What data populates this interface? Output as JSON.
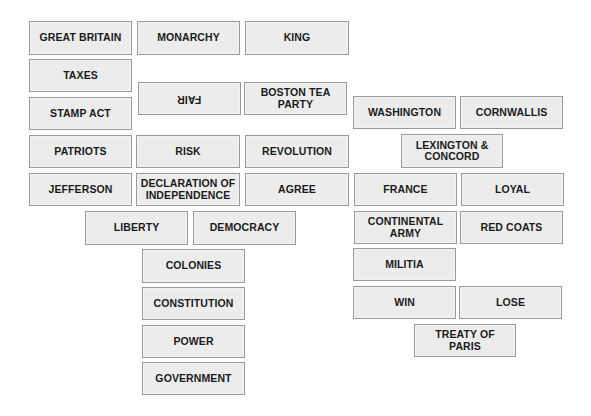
{
  "colors": {
    "card_fill": "#ececec",
    "card_border": "#9a9a9a",
    "card_text": "#1b1b1b",
    "background": "#ffffff"
  },
  "cards": [
    {
      "label": "GREAT BRITAIN",
      "x": 29,
      "y": 21,
      "w": 103,
      "h": 34,
      "rotated": false
    },
    {
      "label": "MONARCHY",
      "x": 137,
      "y": 21,
      "w": 103,
      "h": 34,
      "rotated": false
    },
    {
      "label": "KING",
      "x": 245,
      "y": 21,
      "w": 104,
      "h": 34,
      "rotated": false
    },
    {
      "label": "TAXES",
      "x": 29,
      "y": 59,
      "w": 103,
      "h": 33,
      "rotated": false
    },
    {
      "label": "FAIR",
      "x": 138,
      "y": 82,
      "w": 103,
      "h": 33,
      "rotated": true
    },
    {
      "label": "BOSTON TEA\nPARTY",
      "x": 244,
      "y": 82,
      "w": 103,
      "h": 33,
      "rotated": false
    },
    {
      "label": "STAMP ACT",
      "x": 29,
      "y": 97,
      "w": 103,
      "h": 33,
      "rotated": false
    },
    {
      "label": "WASHINGTON",
      "x": 353,
      "y": 96,
      "w": 103,
      "h": 33,
      "rotated": false
    },
    {
      "label": "CORNWALLIS",
      "x": 460,
      "y": 96,
      "w": 103,
      "h": 33,
      "rotated": false
    },
    {
      "label": "LEXINGTON &\nCONCORD",
      "x": 401,
      "y": 134,
      "w": 102,
      "h": 34,
      "rotated": false
    },
    {
      "label": "PATRIOTS",
      "x": 29,
      "y": 135,
      "w": 103,
      "h": 33,
      "rotated": false
    },
    {
      "label": "RISK",
      "x": 136,
      "y": 135,
      "w": 104,
      "h": 33,
      "rotated": false
    },
    {
      "label": "REVOLUTION",
      "x": 245,
      "y": 135,
      "w": 104,
      "h": 33,
      "rotated": false
    },
    {
      "label": "JEFFERSON",
      "x": 29,
      "y": 173,
      "w": 103,
      "h": 33,
      "rotated": false
    },
    {
      "label": "DECLARATION OF\nINDEPENDENCE",
      "x": 136,
      "y": 173,
      "w": 104,
      "h": 33,
      "rotated": false
    },
    {
      "label": "AGREE",
      "x": 245,
      "y": 173,
      "w": 104,
      "h": 33,
      "rotated": false
    },
    {
      "label": "FRANCE",
      "x": 354,
      "y": 173,
      "w": 103,
      "h": 33,
      "rotated": false
    },
    {
      "label": "LOYAL",
      "x": 461,
      "y": 173,
      "w": 103,
      "h": 33,
      "rotated": false
    },
    {
      "label": "LIBERTY",
      "x": 85,
      "y": 211,
      "w": 103,
      "h": 34,
      "rotated": false
    },
    {
      "label": "DEMOCRACY",
      "x": 193,
      "y": 211,
      "w": 103,
      "h": 34,
      "rotated": false
    },
    {
      "label": "CONTINENTAL\nARMY",
      "x": 354,
      "y": 211,
      "w": 103,
      "h": 33,
      "rotated": false
    },
    {
      "label": "RED COATS",
      "x": 460,
      "y": 211,
      "w": 103,
      "h": 33,
      "rotated": false
    },
    {
      "label": "COLONIES",
      "x": 142,
      "y": 249,
      "w": 103,
      "h": 34,
      "rotated": false
    },
    {
      "label": "MILITIA",
      "x": 353,
      "y": 248,
      "w": 103,
      "h": 33,
      "rotated": false
    },
    {
      "label": "CONSTITUTION",
      "x": 142,
      "y": 287,
      "w": 103,
      "h": 33,
      "rotated": false
    },
    {
      "label": "WIN",
      "x": 353,
      "y": 286,
      "w": 103,
      "h": 33,
      "rotated": false
    },
    {
      "label": "LOSE",
      "x": 459,
      "y": 286,
      "w": 103,
      "h": 33,
      "rotated": false
    },
    {
      "label": "POWER",
      "x": 142,
      "y": 325,
      "w": 103,
      "h": 33,
      "rotated": false
    },
    {
      "label": "TREATY OF PARIS",
      "x": 414,
      "y": 324,
      "w": 102,
      "h": 33,
      "rotated": false
    },
    {
      "label": "GOVERNMENT",
      "x": 142,
      "y": 362,
      "w": 103,
      "h": 33,
      "rotated": false
    }
  ]
}
